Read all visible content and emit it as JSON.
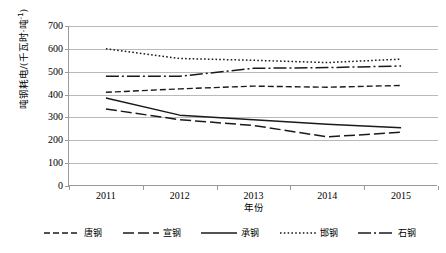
{
  "chart_data": {
    "type": "line",
    "title": "",
    "xlabel": "年份",
    "ylabel": "吨钢耗电/(千瓦时·吨⁻¹)",
    "ylabel_main": "吨钢耗电/(千瓦时·吨",
    "ylabel_sup": "-1",
    "ylabel_tail": ")",
    "categories": [
      "2011",
      "2012",
      "2013",
      "2014",
      "2015"
    ],
    "x": [
      2011,
      2012,
      2013,
      2014,
      2015
    ],
    "ylim": [
      0,
      700
    ],
    "yticks": [
      700,
      600,
      500,
      400,
      300,
      200,
      100,
      0
    ],
    "ytick_labels": [
      "700",
      "600",
      "500",
      "400",
      "300",
      "200",
      "100",
      "0"
    ],
    "grid": true,
    "grid_axis": "y",
    "legend_position": "bottom",
    "series": [
      {
        "name": "唐钢",
        "style": "dashed",
        "dash": "6,3",
        "width": 1.4,
        "color": "#1a1a1a",
        "values": [
          410,
          425,
          437,
          432,
          440
        ]
      },
      {
        "name": "宣钢",
        "style": "long-dashed",
        "dash": "11,4",
        "width": 1.5,
        "color": "#1a1a1a",
        "values": [
          337,
          290,
          265,
          215,
          235
        ]
      },
      {
        "name": "承钢",
        "style": "solid",
        "dash": "none",
        "width": 1.5,
        "color": "#1a1a1a",
        "values": [
          385,
          310,
          290,
          270,
          255
        ]
      },
      {
        "name": "邯钢",
        "style": "dotted",
        "dash": "1.6,2.2",
        "width": 1.5,
        "color": "#1a1a1a",
        "values": [
          600,
          558,
          550,
          540,
          555
        ]
      },
      {
        "name": "石钢",
        "style": "dash-dot",
        "dash": "13,3,2,3",
        "width": 1.5,
        "color": "#1a1a1a",
        "values": [
          480,
          480,
          515,
          518,
          525
        ]
      }
    ]
  },
  "legend": {
    "items": [
      {
        "label": "唐钢"
      },
      {
        "label": "宣钢"
      },
      {
        "label": "承钢"
      },
      {
        "label": "邯钢"
      },
      {
        "label": "石钢"
      }
    ]
  },
  "colors": {
    "ink": "#1a1a1a",
    "grid": "#b9b9b9",
    "axis": "#9a9a9a",
    "background": "#ffffff"
  }
}
